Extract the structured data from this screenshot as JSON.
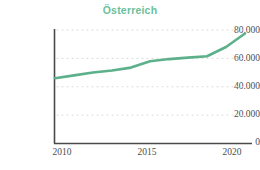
{
  "chart_data": {
    "type": "line",
    "title": "Österreich",
    "xlabel": "",
    "ylabel": "",
    "x": [
      2010,
      2011,
      2012,
      2013,
      2014,
      2015,
      2016,
      2017,
      2018,
      2019,
      2020
    ],
    "series": [
      {
        "name": "Österreich",
        "color": "#5cb08a",
        "values": [
          46000,
          48000,
          50000,
          51500,
          53500,
          58000,
          59500,
          60500,
          61500,
          68000,
          77500
        ]
      }
    ],
    "xlim": [
      2010,
      2020
    ],
    "ylim": [
      0,
      80000
    ],
    "xticks": [
      2010,
      2015,
      2020
    ],
    "xtick_labels": [
      "2010",
      "2015",
      "2020"
    ],
    "yticks": [
      0,
      20000,
      40000,
      60000,
      80000
    ],
    "ytick_labels": [
      "0",
      "20.000",
      "40.000",
      "60.000",
      "80.000"
    ],
    "grid": "horizontal-dotted",
    "legend": "none",
    "background": "#ffffff",
    "axis_color": "#4a4a4a",
    "grid_color": "#d8d8d8",
    "title_color": "#6bbf9a",
    "tick_label_color": "#4c4c4c"
  }
}
